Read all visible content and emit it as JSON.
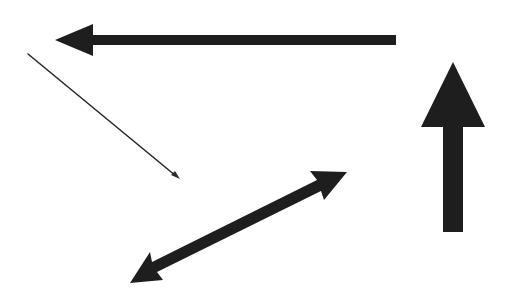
{
  "canvas": {
    "width": 511,
    "height": 298,
    "background": "#ffffff",
    "arrow_color": "#1e1e1e"
  },
  "arrows": [
    {
      "id": "left-arrow",
      "description": "Thick horizontal arrow pointing left",
      "direction": "left",
      "heads": 1,
      "points": "396,35 93,35 93,24 55,40 93,56 93,45 396,45"
    },
    {
      "id": "up-arrow",
      "description": "Thick vertical arrow pointing up",
      "direction": "up",
      "heads": 1,
      "points": "443,232 443,127 421,127 453,62 485,127 463,127 463,232"
    },
    {
      "id": "thin-diagonal-arrow",
      "description": "Thin diagonal line arrow pointing down-right",
      "direction": "down-right",
      "heads": 1,
      "line": {
        "x1": 28,
        "y1": 54,
        "x2": 176,
        "y2": 176
      },
      "head_points": "180,179 171,175 175,171"
    },
    {
      "id": "double-headed-arrow",
      "description": "Thick diagonal double-headed arrow",
      "direction": "bidirectional",
      "heads": 2,
      "points": "130,283 150,252 152,262 317,180 310,171 347,172 324,200 321,191 157,272 163,280"
    }
  ]
}
